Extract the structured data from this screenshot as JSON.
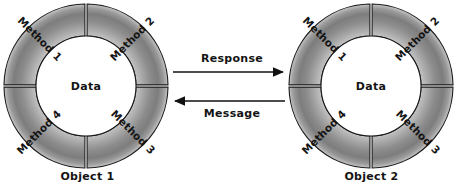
{
  "diagram": {
    "type": "object-messaging",
    "background_color": "#ffffff",
    "objects": [
      {
        "caption": "Object 1",
        "center_label": "Data",
        "segments": [
          "Method 1",
          "Method 2",
          "Method 3",
          "Method 4"
        ],
        "center": {
          "x": 86,
          "y": 86
        },
        "outer_radius": 82,
        "inner_radius": 50
      },
      {
        "caption": "Object 2",
        "center_label": "Data",
        "segments": [
          "Method 1",
          "Method 2",
          "Method 3",
          "Method 4"
        ],
        "center": {
          "x": 371,
          "y": 86
        },
        "outer_radius": 82,
        "inner_radius": 50
      }
    ],
    "flows": [
      {
        "label": "Response",
        "direction": "left-to-right",
        "y": 72
      },
      {
        "label": "Message",
        "direction": "right-to-left",
        "y": 101
      }
    ],
    "colors": {
      "ring_light": "#cccccc",
      "ring_mid": "#8f8f8f",
      "ring_dark": "#6e6e6e",
      "outline": "#1a1a1a",
      "center_fill": "#ffffff",
      "text": "#141414",
      "arrow": "#111111"
    }
  }
}
